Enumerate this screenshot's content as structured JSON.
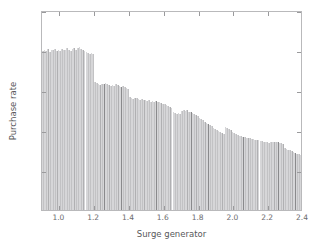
{
  "chart_data": {
    "type": "bar",
    "title": "",
    "xlabel": "Surge generator",
    "ylabel": "Purchase rate",
    "xlim": [
      0.9,
      2.4
    ],
    "ylim": [
      0.2,
      0.7
    ],
    "xticks": [
      "1.0",
      "1.2",
      "1.4",
      "1.6",
      "1.8",
      "2.0",
      "2.2",
      "2.4"
    ],
    "xtick_values": [
      1.0,
      1.2,
      1.4,
      1.6,
      1.8,
      2.0,
      2.2,
      2.4
    ],
    "yticks": [
      "0.2",
      "0.3",
      "0.4",
      "0.5",
      "0.6",
      "0.7"
    ],
    "ytick_values": [
      0.2,
      0.3,
      0.4,
      0.5,
      0.6,
      0.7
    ],
    "grid": false,
    "legend": null,
    "bar_color": "#c2c2c4",
    "separator_color": "#8a8a8c",
    "axis_color": "#b9b9bb",
    "x": [
      0.9,
      0.91,
      0.92,
      0.93,
      0.94,
      0.95,
      0.96,
      0.97,
      0.98,
      0.99,
      1.0,
      1.01,
      1.02,
      1.03,
      1.04,
      1.05,
      1.06,
      1.07,
      1.08,
      1.09,
      1.1,
      1.11,
      1.12,
      1.13,
      1.14,
      1.15,
      1.16,
      1.17,
      1.18,
      1.19,
      1.2,
      1.21,
      1.22,
      1.23,
      1.24,
      1.25,
      1.26,
      1.27,
      1.28,
      1.29,
      1.3,
      1.31,
      1.32,
      1.33,
      1.34,
      1.35,
      1.36,
      1.37,
      1.38,
      1.39,
      1.4,
      1.41,
      1.42,
      1.43,
      1.44,
      1.45,
      1.46,
      1.47,
      1.48,
      1.49,
      1.5,
      1.51,
      1.52,
      1.53,
      1.54,
      1.55,
      1.56,
      1.57,
      1.58,
      1.59,
      1.6,
      1.61,
      1.62,
      1.63,
      1.64,
      1.65,
      1.66,
      1.67,
      1.68,
      1.69,
      1.7,
      1.71,
      1.72,
      1.73,
      1.74,
      1.75,
      1.76,
      1.77,
      1.78,
      1.79,
      1.8,
      1.81,
      1.82,
      1.83,
      1.84,
      1.85,
      1.86,
      1.87,
      1.88,
      1.89,
      1.9,
      1.91,
      1.92,
      1.93,
      1.94,
      1.95,
      1.96,
      1.97,
      1.98,
      1.99,
      2.0,
      2.01,
      2.02,
      2.03,
      2.04,
      2.05,
      2.06,
      2.07,
      2.08,
      2.09,
      2.1,
      2.11,
      2.12,
      2.13,
      2.14,
      2.15,
      2.16,
      2.17,
      2.18,
      2.19,
      2.2,
      2.21,
      2.22,
      2.23,
      2.24,
      2.25,
      2.26,
      2.27,
      2.28,
      2.29,
      2.3,
      2.31,
      2.32,
      2.33,
      2.34,
      2.35,
      2.36,
      2.37,
      2.38,
      2.39
    ],
    "values": [
      0.597,
      0.6,
      0.598,
      0.602,
      0.596,
      0.601,
      0.599,
      0.603,
      0.597,
      0.6,
      0.598,
      0.602,
      0.599,
      0.601,
      0.604,
      0.6,
      0.598,
      0.603,
      0.605,
      0.601,
      0.604,
      0.607,
      0.603,
      0.6,
      0.598,
      0.595,
      0.592,
      0.59,
      0.593,
      0.591,
      0.52,
      0.517,
      0.515,
      0.513,
      0.516,
      0.514,
      0.518,
      0.515,
      0.512,
      0.51,
      0.513,
      0.511,
      0.515,
      0.512,
      0.509,
      0.507,
      0.51,
      0.508,
      0.505,
      0.503,
      0.482,
      0.48,
      0.478,
      0.481,
      0.479,
      0.477,
      0.475,
      0.478,
      0.476,
      0.474,
      0.472,
      0.474,
      0.471,
      0.473,
      0.47,
      0.472,
      0.469,
      0.471,
      0.468,
      0.466,
      0.464,
      0.462,
      0.46,
      0.458,
      0.456,
      0.444,
      0.442,
      0.44,
      0.443,
      0.441,
      0.448,
      0.45,
      0.447,
      0.449,
      0.446,
      0.444,
      0.442,
      0.44,
      0.437,
      0.434,
      0.43,
      0.427,
      0.424,
      0.421,
      0.418,
      0.415,
      0.412,
      0.409,
      0.406,
      0.403,
      0.399,
      0.397,
      0.395,
      0.393,
      0.391,
      0.408,
      0.405,
      0.402,
      0.399,
      0.396,
      0.393,
      0.39,
      0.388,
      0.386,
      0.384,
      0.383,
      0.382,
      0.381,
      0.38,
      0.379,
      0.378,
      0.377,
      0.376,
      0.375,
      0.374,
      0.373,
      0.372,
      0.371,
      0.37,
      0.369,
      0.368,
      0.369,
      0.37,
      0.371,
      0.37,
      0.369,
      0.368,
      0.367,
      0.366,
      0.355,
      0.353,
      0.351,
      0.349,
      0.347,
      0.345,
      0.343,
      0.341,
      0.339,
      0.337,
      0.335
    ],
    "separator_indices": [
      25,
      35,
      45,
      55,
      65,
      75,
      85,
      95,
      105,
      115,
      125,
      135,
      145
    ]
  }
}
